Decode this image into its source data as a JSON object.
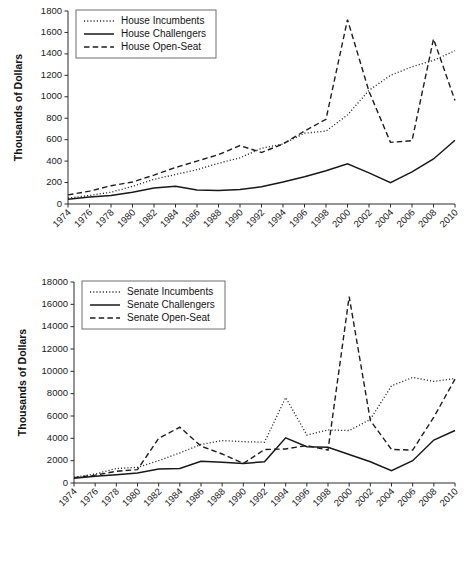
{
  "figure": {
    "background": "#ffffff",
    "ink_color": "#1a1a1a"
  },
  "chart_data": [
    {
      "id": "house",
      "type": "line",
      "title": "",
      "xlabel": "",
      "ylabel": "Thousands of Dollars",
      "x": [
        1974,
        1976,
        1978,
        1980,
        1982,
        1984,
        1986,
        1988,
        1990,
        1992,
        1994,
        1996,
        1998,
        2000,
        2002,
        2004,
        2006,
        2008,
        2010
      ],
      "xlim": [
        1974,
        2010
      ],
      "ylim": [
        0,
        1800
      ],
      "yticks": [
        0,
        200,
        400,
        600,
        800,
        1000,
        1200,
        1400,
        1600,
        1800
      ],
      "xticks": [
        "1974",
        "1976",
        "1978",
        "1980",
        "1982",
        "1984",
        "1986",
        "1988",
        "1990",
        "1992",
        "1994",
        "1996",
        "1998",
        "2000",
        "2002",
        "2004",
        "2006",
        "2008",
        "2010"
      ],
      "grid": false,
      "legend_position": "top-left",
      "series": [
        {
          "name": "House Incumbents",
          "style": "dotted",
          "values": [
            55,
            80,
            110,
            165,
            230,
            275,
            320,
            380,
            430,
            520,
            560,
            660,
            680,
            830,
            1060,
            1200,
            1280,
            1340,
            1430
          ]
        },
        {
          "name": "House Challengers",
          "style": "solid",
          "values": [
            45,
            65,
            80,
            110,
            150,
            165,
            130,
            125,
            135,
            160,
            205,
            255,
            310,
            375,
            290,
            200,
            300,
            420,
            595
          ]
        },
        {
          "name": "House Open-Seat",
          "style": "dashed",
          "values": [
            85,
            120,
            170,
            205,
            270,
            340,
            400,
            460,
            545,
            480,
            560,
            680,
            790,
            1720,
            1050,
            575,
            590,
            1540,
            965
          ]
        }
      ]
    },
    {
      "id": "senate",
      "type": "line",
      "title": "",
      "xlabel": "",
      "ylabel": "Thousands of Dollars",
      "x": [
        1974,
        1976,
        1978,
        1980,
        1982,
        1984,
        1986,
        1988,
        1990,
        1992,
        1994,
        1996,
        1998,
        2000,
        2002,
        2004,
        2006,
        2008,
        2010
      ],
      "xlim": [
        1974,
        2010
      ],
      "ylim": [
        0,
        18000
      ],
      "yticks": [
        0,
        2000,
        4000,
        6000,
        8000,
        10000,
        12000,
        14000,
        16000,
        18000
      ],
      "xticks": [
        "1974",
        "1976",
        "1978",
        "1980",
        "1982",
        "1984",
        "1986",
        "1988",
        "1990",
        "1992",
        "1994",
        "1996",
        "1998",
        "2000",
        "2002",
        "2004",
        "2006",
        "2008",
        "2010"
      ],
      "grid": false,
      "legend_position": "top-left",
      "series": [
        {
          "name": "Senate Incumbents",
          "style": "dotted",
          "values": [
            500,
            800,
            1300,
            1400,
            2000,
            2700,
            3450,
            3800,
            3700,
            3650,
            7650,
            4300,
            4750,
            4700,
            5700,
            8700,
            9450,
            9100,
            9350
          ]
        },
        {
          "name": "Senate Challengers",
          "style": "solid",
          "values": [
            420,
            600,
            750,
            900,
            1250,
            1300,
            1950,
            1850,
            1750,
            1900,
            4050,
            3250,
            3200,
            2550,
            1900,
            1100,
            2000,
            3850,
            4700
          ]
        },
        {
          "name": "Senate Open-Seat",
          "style": "dashed",
          "values": [
            480,
            700,
            1050,
            1200,
            4000,
            5000,
            3300,
            2600,
            1750,
            3000,
            3050,
            3350,
            2950,
            16700,
            5600,
            3000,
            2950,
            5900,
            9300
          ]
        }
      ]
    }
  ]
}
